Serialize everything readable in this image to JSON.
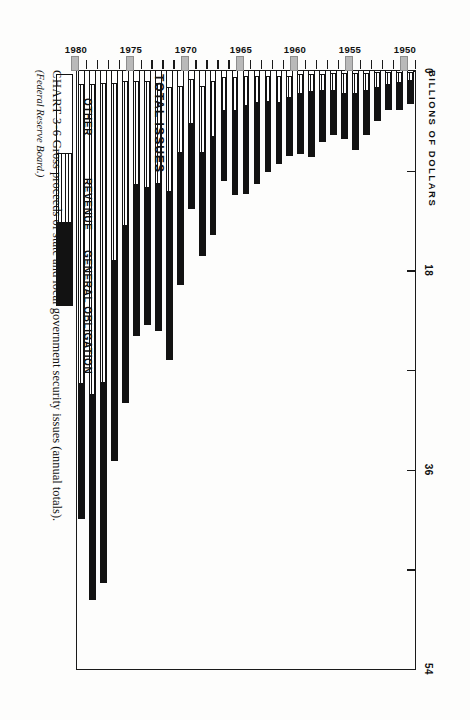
{
  "figure": {
    "caption_label": "CHART 3-6",
    "caption_text": "Gross proceeds of state and local government security issues (annual totals).",
    "source": "(Federal Reserve Board.)"
  },
  "legend": {
    "total_label": "TOTAL ISSUES",
    "items": [
      {
        "key": "other",
        "label": "OTHER",
        "swatch": "white-outline",
        "color": "#ffffff"
      },
      {
        "key": "revenue",
        "label": "REVENUE",
        "swatch": "horizontal-rules",
        "color": "#ffffff"
      },
      {
        "key": "general_obligation",
        "label": "GENERAL OBLIGATION",
        "swatch": "solid-black",
        "color": "#121212"
      }
    ]
  },
  "chart_data": {
    "type": "bar",
    "orientation": "horizontal",
    "stacked": true,
    "title": "Gross proceeds of state and local government security issues (annual totals).",
    "xlabel": "BILLIONS OF DOLLARS",
    "ylabel": "",
    "xlim": [
      0,
      54
    ],
    "xticks": [
      0,
      9,
      18,
      27,
      36,
      45,
      54
    ],
    "xtick_labels": [
      "0",
      "",
      "18",
      "",
      "36",
      "",
      "54"
    ],
    "grid": false,
    "legend_position": "inside-lower-left",
    "categories": [
      "1949",
      "1950",
      "1951",
      "1952",
      "1953",
      "1954",
      "1955",
      "1956",
      "1957",
      "1958",
      "1959",
      "1960",
      "1961",
      "1962",
      "1963",
      "1964",
      "1965",
      "1966",
      "1967",
      "1968",
      "1969",
      "1970",
      "1971",
      "1972",
      "1973",
      "1974",
      "1975",
      "1976",
      "1977",
      "1978",
      "1979"
    ],
    "category_tick_labels": [
      "1950",
      "1955",
      "1960",
      "1965",
      "1970",
      "1975",
      "1980"
    ],
    "series": [
      {
        "name": "GENERAL OBLIGATION",
        "color": "#121212",
        "values": [
          2.1,
          2.4,
          2.2,
          3.0,
          4.0,
          5.0,
          4.0,
          4.0,
          4.6,
          5.9,
          5.4,
          5.3,
          5.5,
          6.3,
          7.3,
          7.9,
          7.6,
          6.3,
          8.8,
          9.3,
          7.7,
          11.9,
          15.2,
          13.3,
          12.3,
          13.6,
          16.0,
          18.0,
          18.0,
          18.5,
          12.2
        ],
        "swatch": "solid-black"
      },
      {
        "name": "REVENUE",
        "color": "#ffffff",
        "values": [
          0.7,
          0.9,
          1.1,
          1.3,
          1.5,
          1.8,
          1.8,
          1.5,
          1.4,
          1.5,
          1.7,
          1.9,
          2.4,
          2.3,
          2.4,
          2.7,
          3.0,
          3.0,
          5.0,
          6.0,
          4.0,
          6.0,
          9.4,
          9.0,
          9.6,
          9.3,
          13.0,
          16.0,
          27.0,
          28.0,
          27.0
        ],
        "swatch": "horizontal-rules"
      },
      {
        "name": "OTHER",
        "color": "#ffffff",
        "values": [
          0.2,
          0.2,
          0.2,
          0.2,
          0.3,
          0.3,
          0.3,
          0.3,
          0.4,
          0.4,
          0.4,
          0.5,
          0.5,
          0.5,
          0.5,
          0.5,
          0.6,
          0.6,
          1.0,
          1.4,
          0.8,
          1.4,
          1.5,
          1.2,
          1.0,
          1.0,
          1.0,
          1.2,
          1.2,
          1.3,
          1.3
        ],
        "swatch": "white-outline"
      }
    ],
    "totals": [
      3.0,
      3.5,
      3.5,
      4.5,
      5.8,
      7.1,
      6.1,
      5.8,
      6.4,
      7.8,
      7.5,
      7.7,
      8.4,
      9.1,
      10.2,
      11.1,
      11.2,
      9.9,
      14.8,
      16.7,
      12.5,
      19.3,
      26.1,
      23.5,
      22.9,
      23.9,
      30.0,
      35.2,
      46.2,
      47.8,
      40.5
    ]
  }
}
